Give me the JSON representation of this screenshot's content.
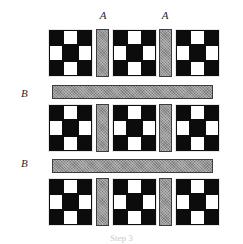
{
  "figure": {
    "caption": "Step 3",
    "width": 243,
    "height": 244,
    "background_color": "#ffffff"
  },
  "colors": {
    "checker_dark": "#0c0c0c",
    "checker_light": "#ffffff",
    "bar_fill": "#7e7e7e",
    "bar_border": "#3d3d3d",
    "label_text": "#2a2a2a",
    "caption_text": "#c9c9c9"
  },
  "labels": {
    "vertical_bar_label": "A",
    "horizontal_bar_label": "B",
    "a_labels": [
      {
        "text": "A",
        "x": 93,
        "y": 10,
        "width": 20
      },
      {
        "text": "A",
        "x": 155,
        "y": 10,
        "width": 20
      }
    ],
    "b_labels": [
      {
        "text": "B",
        "x": 21,
        "y": 88
      },
      {
        "text": "B",
        "x": 21,
        "y": 158
      }
    ]
  },
  "checker_pattern": {
    "rows": 3,
    "cols": 3,
    "cells": [
      [
        "dark",
        "light",
        "dark"
      ],
      [
        "light",
        "dark",
        "light"
      ],
      [
        "dark",
        "light",
        "dark"
      ]
    ]
  },
  "checkerboards": [
    {
      "name": "checkerboard-r1-c1",
      "x": 48,
      "y": 29,
      "width": 45,
      "height": 48
    },
    {
      "name": "checkerboard-r1-c2",
      "x": 112,
      "y": 29,
      "width": 45,
      "height": 48
    },
    {
      "name": "checkerboard-r1-c3",
      "x": 175,
      "y": 29,
      "width": 45,
      "height": 48
    },
    {
      "name": "checkerboard-r2-c1",
      "x": 48,
      "y": 104,
      "width": 45,
      "height": 48
    },
    {
      "name": "checkerboard-r2-c2",
      "x": 112,
      "y": 104,
      "width": 45,
      "height": 48
    },
    {
      "name": "checkerboard-r2-c3",
      "x": 175,
      "y": 104,
      "width": 45,
      "height": 48
    },
    {
      "name": "checkerboard-r3-c1",
      "x": 48,
      "y": 178,
      "width": 45,
      "height": 48
    },
    {
      "name": "checkerboard-r3-c2",
      "x": 112,
      "y": 178,
      "width": 45,
      "height": 48
    },
    {
      "name": "checkerboard-r3-c3",
      "x": 175,
      "y": 178,
      "width": 45,
      "height": 48
    }
  ],
  "vertical_bars": [
    {
      "name": "vertical-bar-a-r1-1",
      "x": 96,
      "y": 29,
      "width": 13,
      "height": 48
    },
    {
      "name": "vertical-bar-a-r1-2",
      "x": 159,
      "y": 29,
      "width": 13,
      "height": 48
    },
    {
      "name": "vertical-bar-a-r2-1",
      "x": 96,
      "y": 104,
      "width": 13,
      "height": 48
    },
    {
      "name": "vertical-bar-a-r2-2",
      "x": 159,
      "y": 104,
      "width": 13,
      "height": 48
    },
    {
      "name": "vertical-bar-a-r3-1",
      "x": 96,
      "y": 178,
      "width": 13,
      "height": 48
    },
    {
      "name": "vertical-bar-a-r3-2",
      "x": 159,
      "y": 178,
      "width": 13,
      "height": 48
    }
  ],
  "horizontal_bars": [
    {
      "name": "horizontal-bar-b-1",
      "x": 52,
      "y": 85,
      "width": 161,
      "height": 14
    },
    {
      "name": "horizontal-bar-b-2",
      "x": 52,
      "y": 159,
      "width": 161,
      "height": 14
    }
  ]
}
